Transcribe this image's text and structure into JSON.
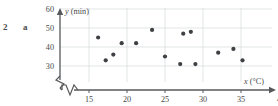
{
  "exercise": {
    "number": "2",
    "part": "a"
  },
  "chart_data": {
    "type": "scatter",
    "title": "",
    "xlabel": "x (°C)",
    "ylabel": "y (min)",
    "xlabel_symbol": "x",
    "xlabel_unit": "(°C)",
    "ylabel_symbol": "y",
    "ylabel_unit": "(min)",
    "x_ticks": [
      15,
      20,
      25,
      30,
      35,
      40
    ],
    "x_tick_labels": [
      "15",
      "20",
      "25",
      "30",
      "35",
      "4"
    ],
    "y_ticks": [
      30,
      40,
      50,
      60
    ],
    "y_tick_labels": [
      "30",
      "40",
      "50",
      "60"
    ],
    "xlim": [
      11.5,
      40.5
    ],
    "ylim": [
      26,
      62
    ],
    "grid": true,
    "axis_break_x": true,
    "axis_break_y": true,
    "legend": null,
    "point_color": "#3f4043",
    "grid_color": "#d6d8da",
    "axis_color": "#57585a",
    "points": [
      {
        "x": 16.2,
        "y": 45
      },
      {
        "x": 17.2,
        "y": 33
      },
      {
        "x": 18.2,
        "y": 36
      },
      {
        "x": 19.3,
        "y": 42
      },
      {
        "x": 21.2,
        "y": 42
      },
      {
        "x": 23.3,
        "y": 49
      },
      {
        "x": 25.0,
        "y": 35
      },
      {
        "x": 27.0,
        "y": 31
      },
      {
        "x": 27.4,
        "y": 47
      },
      {
        "x": 28.4,
        "y": 48
      },
      {
        "x": 29.0,
        "y": 31
      },
      {
        "x": 32.0,
        "y": 37
      },
      {
        "x": 34.0,
        "y": 39
      },
      {
        "x": 35.2,
        "y": 33
      }
    ]
  }
}
